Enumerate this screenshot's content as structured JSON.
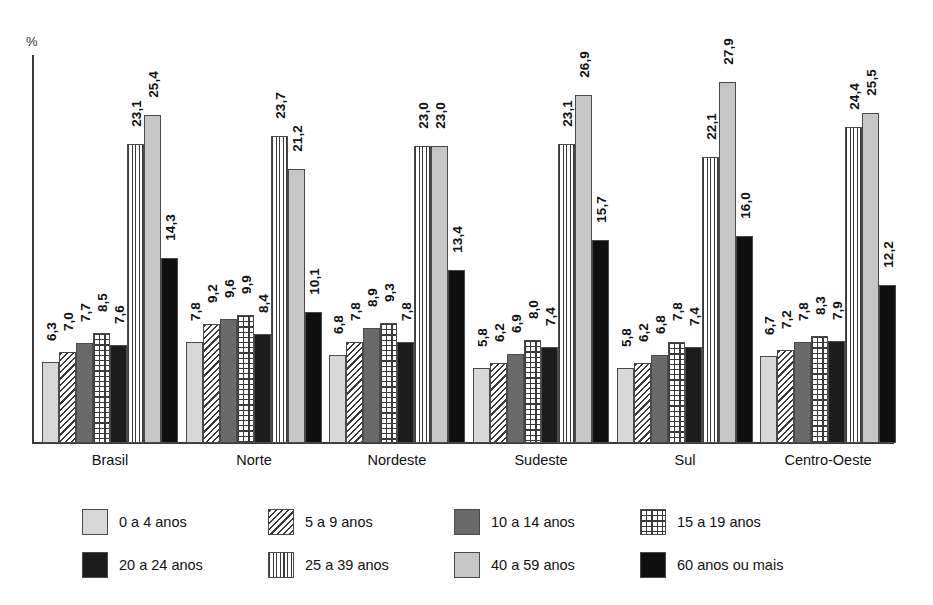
{
  "chart_data": {
    "type": "bar",
    "title": "",
    "subtitle": "",
    "xlabel": "",
    "ylabel": "%",
    "ylim": [
      0,
      30
    ],
    "grid": false,
    "legend_position": "bottom",
    "value_labels_rotated": true,
    "decimal_separator": ",",
    "categories": [
      "Brasil",
      "Norte",
      "Nordeste",
      "Sudeste",
      "Sul",
      "Centro-Oeste"
    ],
    "series": [
      {
        "name": "0 a 4 anos",
        "pattern": "solid-light-gray",
        "color": "#d7d7d7",
        "values": [
          6.3,
          7.8,
          6.8,
          5.8,
          5.8,
          6.7
        ],
        "labels": [
          "6,3",
          "7,8",
          "6,8",
          "5,8",
          "5,8",
          "6,7"
        ]
      },
      {
        "name": "5 a 9 anos",
        "pattern": "diagonal-hatch",
        "color": "#ffffff",
        "values": [
          7.0,
          9.2,
          7.8,
          6.2,
          6.2,
          7.2
        ],
        "labels": [
          "7,0",
          "9,2",
          "7,8",
          "6,2",
          "6,2",
          "7,2"
        ]
      },
      {
        "name": "10 a 14 anos",
        "pattern": "solid-dark-gray",
        "color": "#6a6a6a",
        "values": [
          7.7,
          9.6,
          8.9,
          6.9,
          6.8,
          7.8
        ],
        "labels": [
          "7,7",
          "9,6",
          "8,9",
          "6,9",
          "6,8",
          "7,8"
        ]
      },
      {
        "name": "15 a 19 anos",
        "pattern": "grid",
        "color": "#ffffff",
        "values": [
          8.5,
          9.9,
          9.3,
          8.0,
          7.8,
          8.3
        ],
        "labels": [
          "8,5",
          "9,9",
          "9,3",
          "8,0",
          "7,8",
          "8,3"
        ]
      },
      {
        "name": "20 a 24 anos",
        "pattern": "solid-near-black",
        "color": "#1c1c1c",
        "values": [
          7.6,
          8.4,
          7.8,
          7.4,
          7.4,
          7.9
        ],
        "labels": [
          "7,6",
          "8,4",
          "7,8",
          "7,4",
          "7,4",
          "7,9"
        ]
      },
      {
        "name": "25 a 39 anos",
        "pattern": "vertical-stripes",
        "color": "#ffffff",
        "values": [
          23.1,
          23.7,
          23.0,
          23.1,
          22.1,
          24.4
        ],
        "labels": [
          "23,1",
          "23,7",
          "23,0",
          "23,1",
          "22,1",
          "24,4"
        ]
      },
      {
        "name": "40 a 59 anos",
        "pattern": "solid-light-mid-gray",
        "color": "#c6c6c6",
        "values": [
          25.4,
          21.2,
          23.0,
          26.9,
          27.9,
          25.5
        ],
        "labels": [
          "25,4",
          "21,2",
          "23,0",
          "26,9",
          "27,9",
          "25,5"
        ]
      },
      {
        "name": "60 anos ou mais",
        "pattern": "solid-black",
        "color": "#0f0f0f",
        "values": [
          14.3,
          10.1,
          13.4,
          15.7,
          16.0,
          12.2
        ],
        "labels": [
          "14,3",
          "10,1",
          "13,4",
          "15,7",
          "16,0",
          "12,2"
        ]
      }
    ]
  }
}
